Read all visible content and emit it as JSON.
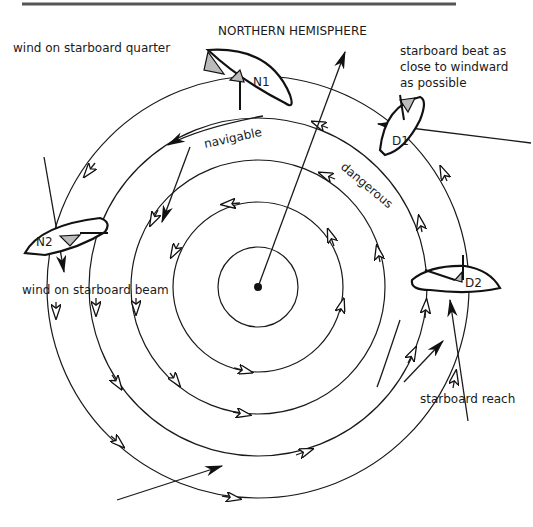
{
  "header": {
    "title": "NORTHERN HEMISPHERE",
    "rule_color": "#555555"
  },
  "center": {
    "x": 258,
    "y": 287
  },
  "rings": [
    40,
    85,
    127,
    169,
    211
  ],
  "zones": {
    "navigable": "navigable",
    "dangerous": "dangerous"
  },
  "boats": [
    {
      "id": "N1",
      "label": "N1",
      "caption": "wind on starboard quarter"
    },
    {
      "id": "N2",
      "label": "N2",
      "caption": "wind on starboard beam"
    },
    {
      "id": "D1",
      "label": "D1",
      "caption_lines": [
        "starboard beat as",
        "close to windward",
        "as possible"
      ]
    },
    {
      "id": "D2",
      "label": "D2",
      "caption": "starboard reach"
    }
  ],
  "colors": {
    "ink": "#1a1a1a",
    "sail_fill": "#bbbbbb",
    "background": "#ffffff"
  }
}
